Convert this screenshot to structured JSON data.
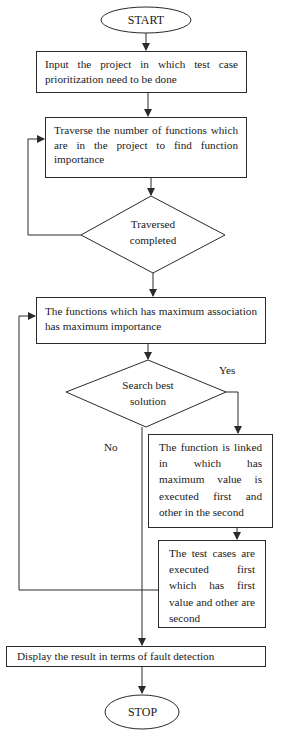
{
  "flowchart": {
    "start": {
      "label": "START"
    },
    "step_input": {
      "text": "Input the project in which test case prioritization need to be done"
    },
    "step_traverse": {
      "text": "Traverse the number of functions which are in the project to find function importance"
    },
    "decision_traversed": {
      "line1": "Traversed",
      "line2": "completed"
    },
    "step_association": {
      "text": "The functions which has maximum association has maximum importance"
    },
    "decision_search": {
      "line1": "Search best",
      "line2": "solution"
    },
    "branch_yes": {
      "label": "Yes"
    },
    "branch_no": {
      "label": "No"
    },
    "step_linked": {
      "text": "The function is linked in which has maximum value is executed first and other in the second"
    },
    "step_testcases": {
      "text": "The test cases are executed first which has first value and other are second"
    },
    "step_display": {
      "text": "Display the result in terms of fault detection"
    },
    "stop": {
      "label": "STOP"
    }
  },
  "colors": {
    "stroke": "#2a2a2a",
    "background": "#ffffff",
    "text": "#1a1a1a"
  }
}
